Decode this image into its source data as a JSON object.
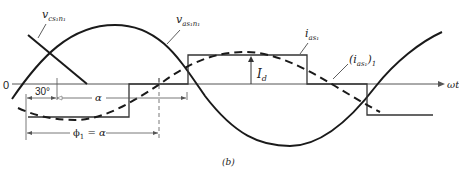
{
  "figure": {
    "caption": "(b)",
    "axis_label": "ωt",
    "origin_label": "0",
    "colors": {
      "ink": "#222222",
      "background": "#ffffff"
    }
  },
  "curves": {
    "v_cs": {
      "label_main": "v",
      "label_sub": "cs₁n₁"
    },
    "v_as": {
      "label_main": "v",
      "label_sub": "as₁n₁"
    },
    "i_as": {
      "label_main": "i",
      "label_sub": "as₁"
    },
    "i_as_fund": {
      "label_open": "(i",
      "label_sub": "as₁",
      "label_close": ")",
      "label_outer_sub": "1"
    }
  },
  "annotations": {
    "amplitude": {
      "main": "I",
      "sub": "d"
    },
    "angle_30": "30°",
    "alpha": "α",
    "phi": {
      "main": "ϕ",
      "sub": "1",
      "rest": " = α"
    }
  }
}
